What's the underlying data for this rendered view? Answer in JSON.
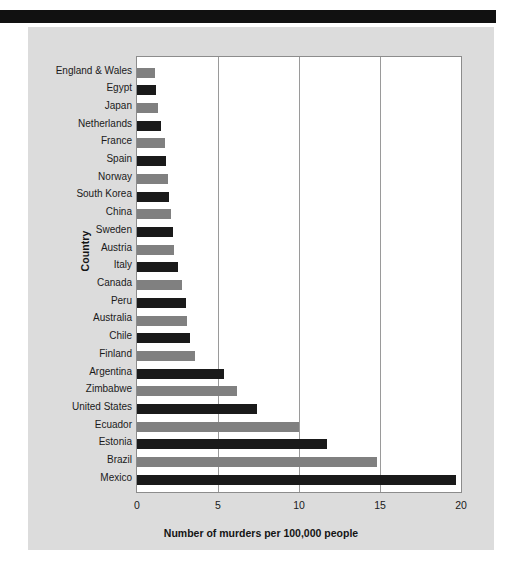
{
  "page": {
    "background": "#ffffff",
    "panel_background": "#dcdcdc",
    "band_color": "#111111"
  },
  "chart_data": {
    "type": "bar",
    "orientation": "horizontal",
    "title": "",
    "xlabel": "Number of murders per 100,000 people",
    "ylabel": "Country",
    "xlim": [
      0,
      20
    ],
    "xticks": [
      0,
      5,
      10,
      15,
      20
    ],
    "xtick_labels": [
      "0",
      "5",
      "10",
      "15",
      "20"
    ],
    "grid": "vertical",
    "legend": "none",
    "plot_background": "#ffffff",
    "bar_colors": [
      "#808080",
      "#1a1a1a"
    ],
    "categories": [
      "England & Wales",
      "Egypt",
      "Japan",
      "Netherlands",
      "France",
      "Spain",
      "Norway",
      "South Korea",
      "China",
      "Sweden",
      "Austria",
      "Italy",
      "Canada",
      "Peru",
      "Australia",
      "Chile",
      "Finland",
      "Argentina",
      "Zimbabwe",
      "United States",
      "Ecuador",
      "Estonia",
      "Brazil",
      "Mexico"
    ],
    "values": [
      1.1,
      1.2,
      1.3,
      1.5,
      1.7,
      1.8,
      1.9,
      2.0,
      2.1,
      2.2,
      2.3,
      2.5,
      2.8,
      3.0,
      3.1,
      3.3,
      3.6,
      5.4,
      6.2,
      7.4,
      10.0,
      11.7,
      14.8,
      19.7
    ]
  }
}
